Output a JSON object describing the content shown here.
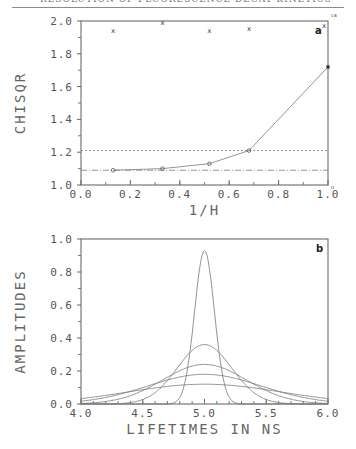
{
  "header": {
    "running_title": "RESOLUTION OF FLUORESCENCE DECAY KINETICS"
  },
  "chart_data": [
    {
      "type": "line",
      "panel": "a",
      "title": "",
      "xlabel": "1/H",
      "ylabel": "CHISQR",
      "xlim": [
        0.0,
        1.0
      ],
      "ylim": [
        1.0,
        2.0
      ],
      "x_ticks": [
        "0.0",
        "0.2",
        "0.4",
        "0.6",
        "0.8",
        "1.0"
      ],
      "y_ticks": [
        "1.0",
        "1.2",
        "1.4",
        "1.6",
        "1.8",
        "2.0"
      ],
      "grid": false,
      "series": [
        {
          "name": "chisqr (circles)",
          "marker": "circle",
          "line": "solid",
          "x": [
            0.13,
            0.33,
            0.52,
            0.68,
            1.0
          ],
          "y": [
            1.09,
            1.1,
            1.13,
            1.21,
            1.72
          ]
        },
        {
          "name": "x markers",
          "marker": "x",
          "line": "none",
          "x": [
            0.13,
            0.33,
            0.52,
            0.68,
            1.0
          ],
          "y": [
            1.94,
            1.99,
            1.94,
            1.95,
            1.97
          ]
        }
      ],
      "reference_lines": [
        {
          "y": 1.21,
          "style": "dashed"
        },
        {
          "y": 1.09,
          "style": "dash-dot"
        }
      ],
      "annotations": [
        "a",
        "ca",
        "o"
      ]
    },
    {
      "type": "line",
      "panel": "b",
      "title": "",
      "xlabel": "LIFETIMES IN NS",
      "ylabel": "AMPLITUDES",
      "xlim": [
        4.0,
        6.0
      ],
      "ylim": [
        0.0,
        1.0
      ],
      "x_ticks": [
        "4.0",
        "4.5",
        "5.0",
        "5.5",
        "6.0"
      ],
      "y_ticks": [
        "0.0",
        "0.2",
        "0.4",
        "0.6",
        "0.8",
        "1.0"
      ],
      "grid": false,
      "series": [
        {
          "name": "distribution 1",
          "center": 5.0,
          "peak": 0.93,
          "width": 0.08
        },
        {
          "name": "distribution 2",
          "center": 5.0,
          "peak": 0.36,
          "width": 0.22
        },
        {
          "name": "distribution 3",
          "center": 5.0,
          "peak": 0.24,
          "width": 0.34
        },
        {
          "name": "distribution 4",
          "center": 5.0,
          "peak": 0.18,
          "width": 0.46
        },
        {
          "name": "distribution 5",
          "center": 5.0,
          "peak": 0.12,
          "width": 0.62
        }
      ],
      "annotations": [
        "b"
      ]
    }
  ]
}
